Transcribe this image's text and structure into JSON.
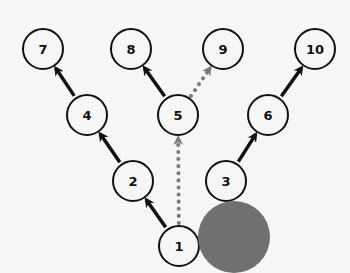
{
  "diagram": {
    "type": "tree-graph",
    "colors": {
      "background": "#f6f6f6",
      "node_stroke": "#111111",
      "node_fill": "#f6f6f6",
      "arrow_solid": "#111111",
      "arrow_dotted": "#7a7a7a",
      "blob": "#707070"
    },
    "nodes": [
      {
        "id": "1",
        "label": "1",
        "x": 179,
        "y": 246
      },
      {
        "id": "2",
        "label": "2",
        "x": 133,
        "y": 181
      },
      {
        "id": "3",
        "label": "3",
        "x": 226,
        "y": 181
      },
      {
        "id": "4",
        "label": "4",
        "x": 87,
        "y": 115
      },
      {
        "id": "5",
        "label": "5",
        "x": 178,
        "y": 115
      },
      {
        "id": "6",
        "label": "6",
        "x": 268,
        "y": 115
      },
      {
        "id": "7",
        "label": "7",
        "x": 43,
        "y": 49
      },
      {
        "id": "8",
        "label": "8",
        "x": 131,
        "y": 49
      },
      {
        "id": "9",
        "label": "9",
        "x": 223,
        "y": 49
      },
      {
        "id": "10",
        "label": "10",
        "x": 315,
        "y": 49
      }
    ],
    "edges": [
      {
        "from": "1",
        "to": "2",
        "style": "solid"
      },
      {
        "from": "2",
        "to": "4",
        "style": "solid"
      },
      {
        "from": "4",
        "to": "7",
        "style": "solid"
      },
      {
        "from": "5",
        "to": "8",
        "style": "solid"
      },
      {
        "from": "3",
        "to": "6",
        "style": "solid"
      },
      {
        "from": "6",
        "to": "10",
        "style": "solid"
      },
      {
        "from": "5",
        "to": "9",
        "style": "dotted"
      },
      {
        "from": "1",
        "to": "5",
        "style": "dotted"
      }
    ],
    "blob": {
      "x": 234,
      "y": 237,
      "r": 36
    }
  }
}
